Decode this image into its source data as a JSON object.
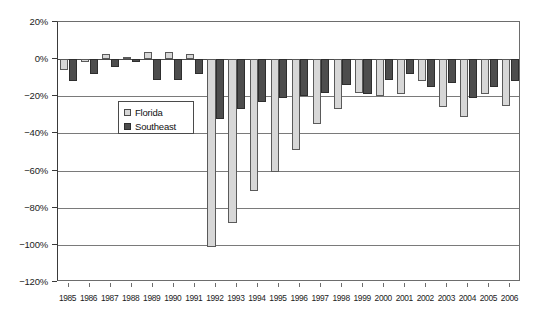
{
  "chart_data": {
    "type": "bar",
    "title": "",
    "xlabel": "",
    "ylabel": "",
    "ylim": [
      -120,
      20
    ],
    "ytick_values": [
      20,
      0,
      -20,
      -40,
      -60,
      -80,
      -100,
      -120
    ],
    "ytick_labels": [
      "20%",
      "0%",
      "-20%",
      "-40%",
      "-60%",
      "-80%",
      "-100%",
      "-120%"
    ],
    "grid": true,
    "legend_position": "upper-left-inside",
    "categories": [
      "1985",
      "1986",
      "1987",
      "1988",
      "1989",
      "1990",
      "1991",
      "1992",
      "1993",
      "1994",
      "1995",
      "1996",
      "1997",
      "1998",
      "1999",
      "2000",
      "2001",
      "2002",
      "2003",
      "2004",
      "2005",
      "2006"
    ],
    "series": [
      {
        "name": "Florida",
        "color": "#d7d7d7",
        "values": [
          -6,
          -1.5,
          3,
          1,
          4,
          4,
          3,
          -101,
          -88,
          -71,
          -61,
          -49,
          -35,
          -27,
          -18,
          -20,
          -19,
          -12,
          -26,
          -31,
          -19,
          -25
        ]
      },
      {
        "name": "Southeast",
        "color": "#4d4d4d",
        "values": [
          -12,
          -8,
          -4,
          -1.5,
          -11,
          -11,
          -8,
          -32,
          -27,
          -23,
          -21,
          -20,
          -18,
          -14,
          -19,
          -11,
          -8,
          -15,
          -13,
          -21,
          -15,
          -12
        ]
      }
    ]
  },
  "legend": {
    "items": [
      {
        "label": "Florida",
        "swatch": "florida"
      },
      {
        "label": "Southeast",
        "swatch": "southeast"
      }
    ]
  }
}
